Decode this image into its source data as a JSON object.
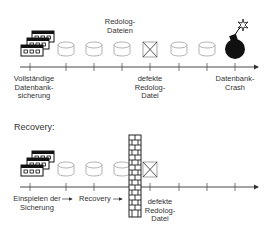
{
  "top_timeline": {
    "labels": {
      "full_backup": [
        "Vollständige",
        "Datenbank-",
        "sicherung"
      ],
      "redolog_files": [
        "Redolog-",
        "Dateien"
      ],
      "defective_redolog": [
        "defekte",
        "Redolog-",
        "Datei"
      ],
      "db_crash": [
        "Datenbank-",
        "Crash"
      ]
    }
  },
  "recovery_section": {
    "title": "Recovery:",
    "labels": {
      "restore_backup": [
        "Einspielen der",
        "Sicherung"
      ],
      "recovery": "Recovery",
      "defective_redolog": [
        "defekte",
        "Redolog-",
        "Datei"
      ]
    }
  },
  "colors": {
    "line": "#333333",
    "cylinder_stroke": "#aaaaaa",
    "wall": "#222222"
  }
}
